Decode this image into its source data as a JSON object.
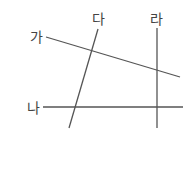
{
  "diagram": {
    "title": "",
    "lines": [
      {
        "id": "ga",
        "label": "가",
        "x1": 46,
        "y1": 37,
        "x2": 180,
        "y2": 77,
        "label_x": 30,
        "label_y": 42
      },
      {
        "id": "na",
        "label": "나",
        "x1": 43,
        "y1": 107,
        "x2": 183,
        "y2": 107,
        "label_x": 27,
        "label_y": 113
      },
      {
        "id": "da",
        "label": "다",
        "x1": 98,
        "y1": 29,
        "x2": 69,
        "y2": 128,
        "label_x": 92,
        "label_y": 24
      },
      {
        "id": "ra",
        "label": "라",
        "x1": 157,
        "y1": 28,
        "x2": 157,
        "y2": 128,
        "label_x": 150,
        "label_y": 24
      }
    ],
    "colors": {
      "line": "#555555",
      "label": "#444444"
    }
  }
}
